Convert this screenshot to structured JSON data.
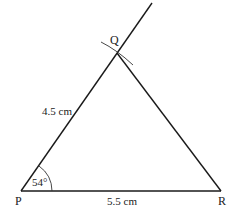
{
  "diagram": {
    "type": "triangle-construction",
    "vertices": {
      "P": {
        "label": "P",
        "x": 21,
        "y": 191
      },
      "Q": {
        "label": "Q",
        "x": 117,
        "y": 53
      },
      "R": {
        "label": "R",
        "x": 221,
        "y": 191
      }
    },
    "ray_end": {
      "x": 152,
      "y": 3
    },
    "sides": {
      "PQ": {
        "label": "4.5 cm"
      },
      "PR": {
        "label": "5.5 cm"
      }
    },
    "angle_P": {
      "label": "54°"
    },
    "colors": {
      "line": "#1a1a1a",
      "background": "#ffffff"
    }
  }
}
